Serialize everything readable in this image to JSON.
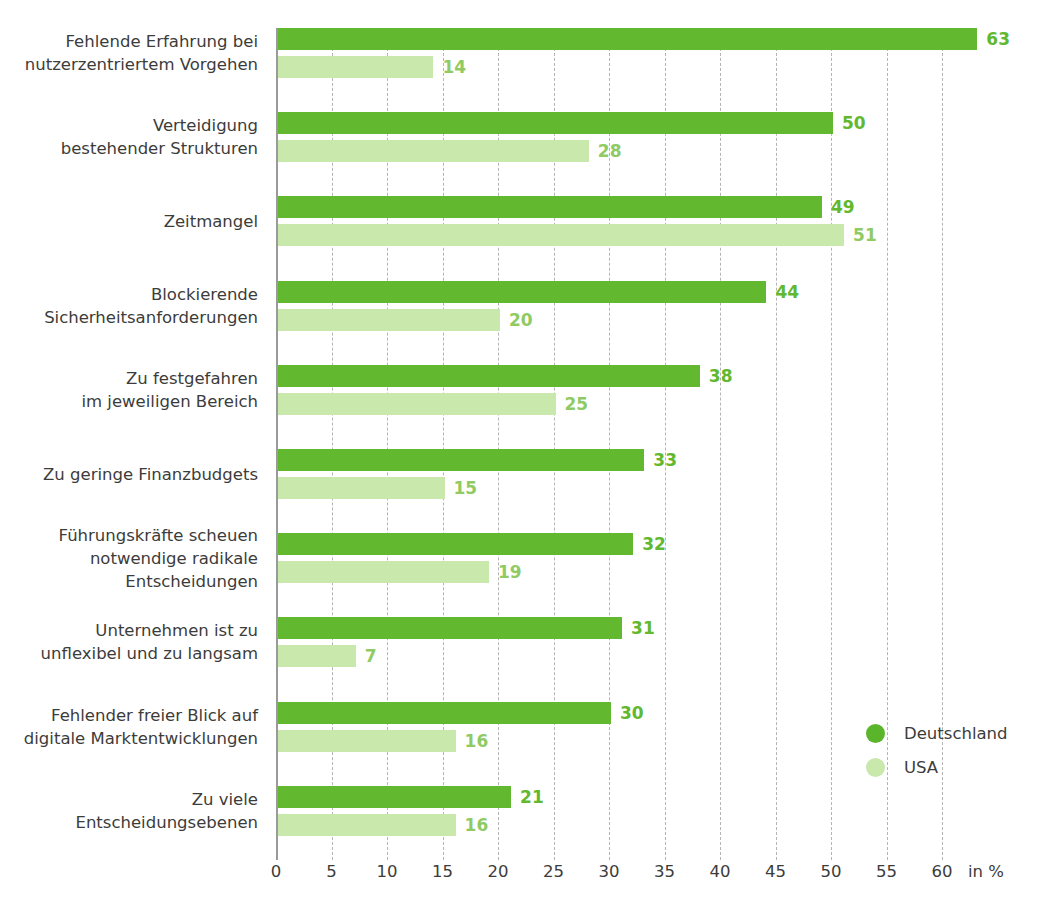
{
  "chart_data": {
    "type": "bar",
    "orientation": "horizontal",
    "title": "",
    "subtitle": "",
    "xlabel": "in %",
    "ylabel": "",
    "xlim": [
      0,
      60
    ],
    "xticks": [
      0,
      5,
      10,
      15,
      20,
      25,
      30,
      35,
      40,
      45,
      50,
      55,
      60
    ],
    "xtick_labels": [
      "0",
      "5",
      "10",
      "15",
      "20",
      "25",
      "30",
      "35",
      "40",
      "45",
      "50",
      "55",
      "60"
    ],
    "grid": true,
    "grid_style": "dashed-vertical",
    "legend_position": "bottom-right",
    "categories": [
      "Fehlende Erfahrung bei\nnutzerzentriertem Vorgehen",
      "Verteidigung\nbestehender Strukturen",
      "Zeitmangel",
      "Blockierende\nSicherheitsanforderungen",
      "Zu festgefahren\nim jeweiligen Bereich",
      "Zu geringe Finanzbudgets",
      "Führungskräfte scheuen\nnotwendige radikale\nEntscheidungen",
      "Unternehmen ist zu\nunflexibel und zu langsam",
      "Fehlender freier Blick auf\ndigitale Marktentwicklungen",
      "Zu viele\nEntscheidungsebenen"
    ],
    "series": [
      {
        "name": "Deutschland",
        "color": "#62b82e",
        "values": [
          63,
          50,
          49,
          44,
          38,
          33,
          32,
          31,
          30,
          21
        ],
        "value_labels": [
          "63",
          "50",
          "49",
          "44",
          "38",
          "33",
          "32",
          "31",
          "30",
          "21"
        ]
      },
      {
        "name": "USA",
        "color": "#c9e8ac",
        "values": [
          14,
          28,
          51,
          20,
          25,
          15,
          19,
          7,
          16,
          16
        ],
        "value_labels": [
          "14",
          "28",
          "51",
          "20",
          "25",
          "15",
          "19",
          "7",
          "16",
          "16"
        ]
      }
    ]
  },
  "legend": {
    "items": [
      {
        "label": "Deutschland",
        "color": "#62b82e"
      },
      {
        "label": "USA",
        "color": "#c9e8ac"
      }
    ]
  },
  "axis": {
    "unit_label": "in %"
  },
  "colors": {
    "deutschland": "#62b82e",
    "usa": "#c9e8ac",
    "usa_label": "#8fcb62",
    "text": "#3c3c3b",
    "grid": "#b4b4b4",
    "axis": "#9a9a9a",
    "background": "#ffffff"
  }
}
